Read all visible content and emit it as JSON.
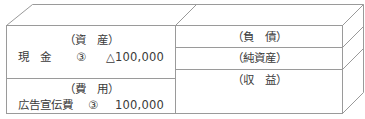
{
  "diagram": {
    "type": "t-account-box",
    "left": {
      "assets": {
        "heading": "（資　産）",
        "entry": {
          "account": "現　金",
          "ref": "③",
          "amount": "△100,000"
        }
      },
      "expenses": {
        "heading": "（費　用）",
        "entry": {
          "account": "広告宣伝費",
          "ref": "③",
          "amount": "100,000"
        }
      }
    },
    "right": {
      "liabilities": {
        "heading": "（負　債）"
      },
      "net_assets": {
        "heading": "（純資産）"
      },
      "revenue": {
        "heading": "（収　益）"
      }
    },
    "colors": {
      "line": "#9a9a9a",
      "text": "#3a3a3a"
    }
  }
}
